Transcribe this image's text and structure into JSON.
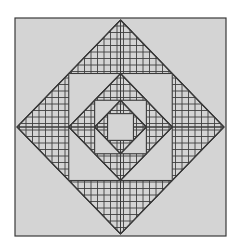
{
  "figure": {
    "title": "Nested hatched diamond-in-square pattern",
    "canvas": {
      "width": 239,
      "height": 252,
      "background": "#ffffff"
    },
    "colors": {
      "background": "#ffffff",
      "fill": "#d4d4d4",
      "stroke": "#3a3a3a",
      "hatch": "#3f3f3f"
    },
    "outer_frame": {
      "name": "outer-square-frame",
      "x": 15,
      "y": 18,
      "width": 211,
      "height": 218,
      "fill": "#d4d4d4",
      "stroke": "#3a3a3a",
      "stroke_width": 1.2
    },
    "center": {
      "cx": 120.5,
      "cy": 127
    },
    "hatch": {
      "spacing": 6.5,
      "line_width": 0.9,
      "horizontal_quadrants": [
        "top",
        "bottom"
      ],
      "vertical_quadrants": [
        "left",
        "right"
      ]
    },
    "rings": [
      {
        "index": 0,
        "shape": "diamond",
        "name": "diamond-ring-outer",
        "radius_x": 103.5,
        "radius_y": 107,
        "vertices": {
          "top": [
            120.5,
            20
          ],
          "right": [
            224,
            127
          ],
          "bottom": [
            120.5,
            234
          ],
          "left": [
            17,
            127
          ]
        },
        "quadrants": [
          {
            "name": "quadrant-top",
            "hatch": "horizontal"
          },
          {
            "name": "quadrant-right",
            "hatch": "vertical"
          },
          {
            "name": "quadrant-bottom",
            "hatch": "horizontal"
          },
          {
            "name": "quadrant-left",
            "hatch": "vertical"
          }
        ]
      },
      {
        "index": 1,
        "shape": "square",
        "name": "square-ring-1",
        "x": 68.75,
        "y": 73.5,
        "width": 103.5,
        "height": 107,
        "fill": "#d4d4d4"
      },
      {
        "index": 2,
        "shape": "diamond",
        "name": "diamond-ring-2",
        "radius_x": 51.75,
        "radius_y": 53.5,
        "vertices": {
          "top": [
            120.5,
            73.5
          ],
          "right": [
            172.25,
            127
          ],
          "bottom": [
            120.5,
            180.5
          ],
          "left": [
            68.75,
            127
          ]
        },
        "quadrants": [
          {
            "name": "quadrant-top",
            "hatch": "horizontal"
          },
          {
            "name": "quadrant-right",
            "hatch": "vertical"
          },
          {
            "name": "quadrant-bottom",
            "hatch": "horizontal"
          },
          {
            "name": "quadrant-left",
            "hatch": "vertical"
          }
        ]
      },
      {
        "index": 3,
        "shape": "square",
        "name": "square-ring-3",
        "x": 94.63,
        "y": 100.25,
        "width": 51.75,
        "height": 53.5,
        "fill": "#d4d4d4"
      },
      {
        "index": 4,
        "shape": "diamond",
        "name": "diamond-ring-4",
        "radius_x": 25.88,
        "radius_y": 26.75,
        "vertices": {
          "top": [
            120.5,
            100.25
          ],
          "right": [
            146.38,
            127
          ],
          "bottom": [
            120.5,
            153.75
          ],
          "left": [
            94.63,
            127
          ]
        },
        "quadrants": [
          {
            "name": "quadrant-top",
            "hatch": "horizontal"
          },
          {
            "name": "quadrant-right",
            "hatch": "vertical"
          },
          {
            "name": "quadrant-bottom",
            "hatch": "horizontal"
          },
          {
            "name": "quadrant-left",
            "hatch": "vertical"
          }
        ]
      },
      {
        "index": 5,
        "shape": "square",
        "name": "square-ring-5-center",
        "x": 107.56,
        "y": 113.63,
        "width": 25.88,
        "height": 26.75,
        "fill": "#d4d4d4"
      }
    ]
  }
}
